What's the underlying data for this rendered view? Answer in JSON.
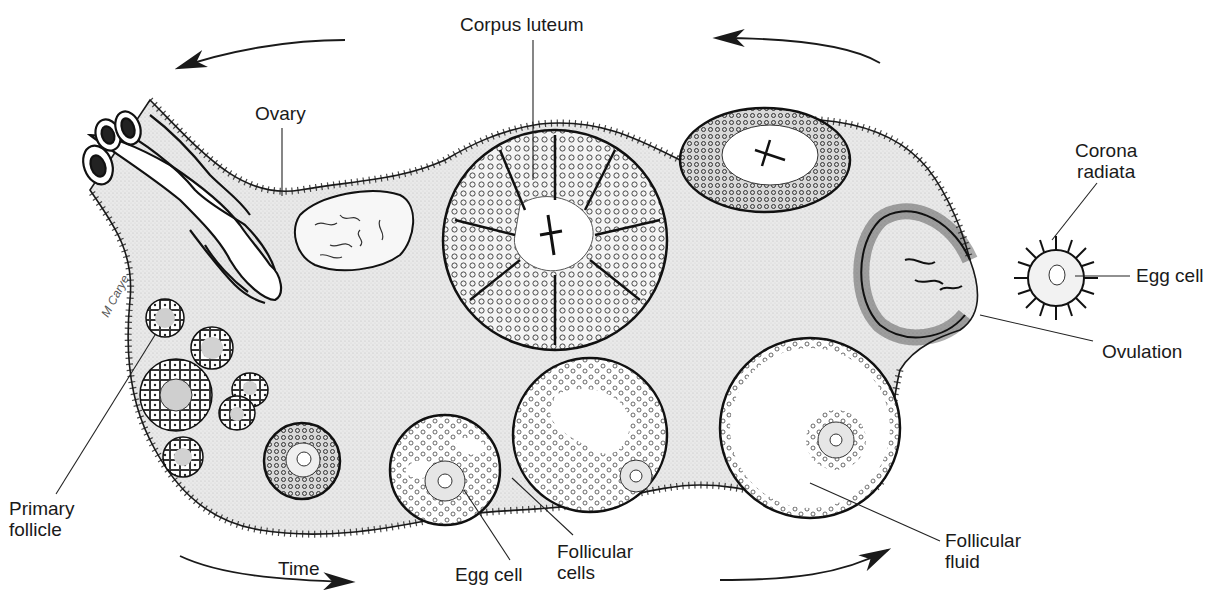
{
  "figure": {
    "colors": {
      "background": "#ffffff",
      "ovary_fill": "#e6e6e6",
      "ink": "#1a1a1a",
      "follicle_fill": "#ffffff",
      "fluid": "#ffffff"
    },
    "labels": {
      "corpus_luteum": "Corpus luteum",
      "ovary": "Ovary",
      "corona_radiata": "Corona\nradiata",
      "egg_cell_right": "Egg cell",
      "ovulation": "Ovulation",
      "follicular_fluid": "Follicular\nfluid",
      "follicular_cells": "Follicular\ncells",
      "egg_cell_bottom": "Egg cell",
      "time": "Time",
      "primary_follicle": "Primary\nfollicle"
    },
    "signature": "M Carye",
    "arrows": [
      {
        "name": "top-left-arrow",
        "direction": "left"
      },
      {
        "name": "top-right-arrow",
        "direction": "left"
      },
      {
        "name": "bottom-left-arrow",
        "direction": "right"
      },
      {
        "name": "bottom-right-arrow",
        "direction": "right"
      }
    ],
    "structures": [
      "fallopian-tube-fimbriae",
      "corpus-albicans",
      "corpus-luteum",
      "regressing-corpus-luteum",
      "ruptured-follicle",
      "released-ovum",
      "primary-follicles",
      "secondary-follicle",
      "early-antral-follicle",
      "antral-follicle",
      "mature-graafian-follicle"
    ]
  }
}
